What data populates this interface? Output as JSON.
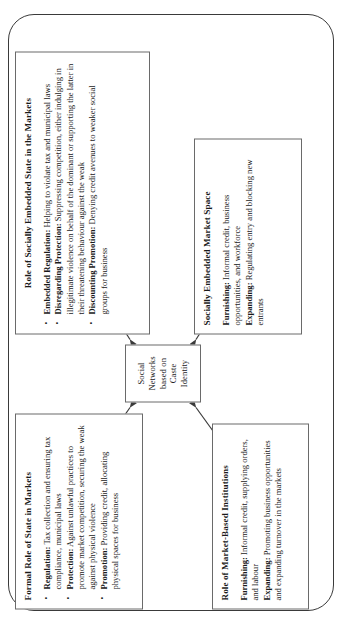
{
  "figure": {
    "type": "diagram",
    "orientation": "rotated-90-ccw",
    "frame": "rounded-rectangle-border"
  },
  "center_node": {
    "label": "Social\nNetworks\nbased on\nCaste Identity",
    "label_flat": "Social Networks based on Caste Identity",
    "lines": [
      "Social",
      "Networks",
      "based on",
      "Caste Identity"
    ]
  },
  "nodes": {
    "formal_state": {
      "title": "Formal Role of State in Markets",
      "bullets": [
        {
          "lead": "Regulation:",
          "text": " Tax collection and ensuring tax compliance, municipal laws"
        },
        {
          "lead": "Protection:",
          "text": " Against unlawful practices to promote market competition, securing the weak against physical violence"
        },
        {
          "lead": "Promotion:",
          "text": " Providing credit, allocating physical spaces for business"
        }
      ]
    },
    "embedded_state": {
      "title": "Role of Socially Embedded State in the Markets",
      "bullets": [
        {
          "lead": "Embedded Regulation:",
          "text": " Helping to violate tax and municipal laws"
        },
        {
          "lead": "Disregarding Protection:",
          "text": " Suppressing competition, either indulging in illegitimate violence on behalf of the dominant or supporting the latter in their threatening behaviour against the weak"
        },
        {
          "lead": "Discounting Promotion:",
          "text": " Denying credit avenues to weaker social groups for business"
        }
      ]
    },
    "market_institutions": {
      "title": "Role of Market-Based Institutions",
      "paragraphs": [
        {
          "lead": "Furnishing:",
          "text": " Informal credit, supplying orders, and labour"
        },
        {
          "lead": "Expanding:",
          "text": " Promoting business opportunities and expanding turnover in the markets"
        }
      ]
    },
    "market_space": {
      "title": "Socially Embedded Market Space",
      "paragraphs": [
        {
          "lead": "Furnishing:",
          "text": " Informal credit, business opportunities, and workforce"
        },
        {
          "lead": "Expanding:",
          "text": " Regulating entry and blocking new entrants"
        }
      ]
    }
  },
  "connectors": [
    {
      "name": "center-to-formal-state",
      "style": "double-headed-arrow"
    },
    {
      "name": "center-to-embedded-state",
      "style": "double-headed-arrow"
    },
    {
      "name": "center-to-market-institutions",
      "style": "double-headed-arrow"
    },
    {
      "name": "center-to-market-space",
      "style": "double-headed-arrow"
    }
  ],
  "colors": {
    "border": "#6a6a6a",
    "arrow": "#3a3a3a",
    "frame": "#3a3a3a",
    "text": "#1a1a1a",
    "background": "#ffffff"
  }
}
